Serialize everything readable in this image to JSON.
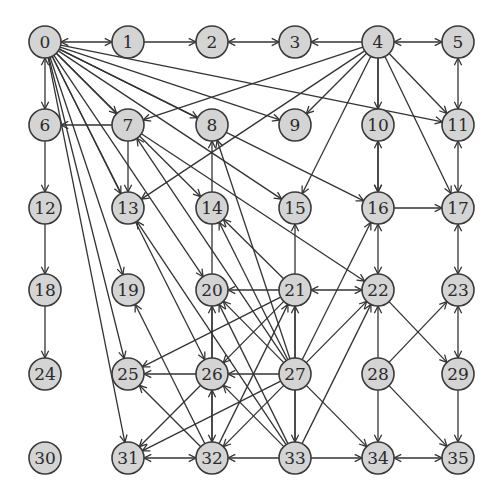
{
  "diagram": {
    "type": "directed-graph",
    "node_radius": 16,
    "colors": {
      "node_fill": "#d4d4d4",
      "node_stroke": "#3a3a3a",
      "edge": "#333333",
      "label": "#2a2a2a"
    },
    "columns_x": [
      45,
      128,
      212,
      295,
      378,
      458
    ],
    "rows_y": [
      42,
      125,
      208,
      290,
      374,
      458
    ],
    "nodes": [
      {
        "id": "0",
        "label": "0"
      },
      {
        "id": "1",
        "label": "1"
      },
      {
        "id": "2",
        "label": "2"
      },
      {
        "id": "3",
        "label": "3"
      },
      {
        "id": "4",
        "label": "4"
      },
      {
        "id": "5",
        "label": "5"
      },
      {
        "id": "6",
        "label": "6"
      },
      {
        "id": "7",
        "label": "7"
      },
      {
        "id": "8",
        "label": "8"
      },
      {
        "id": "9",
        "label": "9"
      },
      {
        "id": "10",
        "label": "10"
      },
      {
        "id": "11",
        "label": "11"
      },
      {
        "id": "12",
        "label": "12"
      },
      {
        "id": "13",
        "label": "13"
      },
      {
        "id": "14",
        "label": "14"
      },
      {
        "id": "15",
        "label": "15"
      },
      {
        "id": "16",
        "label": "16"
      },
      {
        "id": "17",
        "label": "17"
      },
      {
        "id": "18",
        "label": "18"
      },
      {
        "id": "19",
        "label": "19"
      },
      {
        "id": "20",
        "label": "20"
      },
      {
        "id": "21",
        "label": "21"
      },
      {
        "id": "22",
        "label": "22"
      },
      {
        "id": "23",
        "label": "23"
      },
      {
        "id": "24",
        "label": "24"
      },
      {
        "id": "25",
        "label": "25"
      },
      {
        "id": "26",
        "label": "26"
      },
      {
        "id": "27",
        "label": "27"
      },
      {
        "id": "28",
        "label": "28"
      },
      {
        "id": "29",
        "label": "29"
      },
      {
        "id": "30",
        "label": "30"
      },
      {
        "id": "31",
        "label": "31"
      },
      {
        "id": "32",
        "label": "32"
      },
      {
        "id": "33",
        "label": "33"
      },
      {
        "id": "34",
        "label": "34"
      },
      {
        "id": "35",
        "label": "35"
      }
    ],
    "edges": [
      {
        "from": 0,
        "to": 1,
        "bi": true
      },
      {
        "from": 1,
        "to": 2,
        "bi": false
      },
      {
        "from": 3,
        "to": 2,
        "bi": true
      },
      {
        "from": 4,
        "to": 3,
        "bi": false
      },
      {
        "from": 4,
        "to": 5,
        "bi": true
      },
      {
        "from": 0,
        "to": 6,
        "bi": true
      },
      {
        "from": 0,
        "to": 7,
        "bi": false
      },
      {
        "from": 0,
        "to": 8,
        "bi": false
      },
      {
        "from": 0,
        "to": 9,
        "bi": false
      },
      {
        "from": 0,
        "to": 11,
        "bi": false
      },
      {
        "from": 0,
        "to": 13,
        "bi": false
      },
      {
        "from": 0,
        "to": 14,
        "bi": false
      },
      {
        "from": 0,
        "to": 15,
        "bi": false
      },
      {
        "from": 0,
        "to": 16,
        "bi": false
      },
      {
        "from": 0,
        "to": 19,
        "bi": false
      },
      {
        "from": 0,
        "to": 20,
        "bi": false
      },
      {
        "from": 0,
        "to": 25,
        "bi": false
      },
      {
        "from": 0,
        "to": 26,
        "bi": false
      },
      {
        "from": 0,
        "to": 31,
        "bi": false
      },
      {
        "from": 4,
        "to": 7,
        "bi": false
      },
      {
        "from": 4,
        "to": 9,
        "bi": false
      },
      {
        "from": 4,
        "to": 10,
        "bi": false
      },
      {
        "from": 4,
        "to": 11,
        "bi": false
      },
      {
        "from": 4,
        "to": 13,
        "bi": false
      },
      {
        "from": 4,
        "to": 15,
        "bi": false
      },
      {
        "from": 4,
        "to": 17,
        "bi": false
      },
      {
        "from": 4,
        "to": 16,
        "bi": false
      },
      {
        "from": 7,
        "to": 6,
        "bi": false
      },
      {
        "from": 7,
        "to": 13,
        "bi": false
      },
      {
        "from": 7,
        "to": 22,
        "bi": false
      },
      {
        "from": 5,
        "to": 11,
        "bi": true
      },
      {
        "from": 10,
        "to": 16,
        "bi": true
      },
      {
        "from": 11,
        "to": 17,
        "bi": true
      },
      {
        "from": 6,
        "to": 12,
        "bi": false
      },
      {
        "from": 12,
        "to": 18,
        "bi": false
      },
      {
        "from": 18,
        "to": 24,
        "bi": false
      },
      {
        "from": 16,
        "to": 17,
        "bi": false
      },
      {
        "from": 16,
        "to": 22,
        "bi": true
      },
      {
        "from": 17,
        "to": 23,
        "bi": true
      },
      {
        "from": 23,
        "to": 29,
        "bi": true
      },
      {
        "from": 22,
        "to": 21,
        "bi": true
      },
      {
        "from": 21,
        "to": 20,
        "bi": false
      },
      {
        "from": 21,
        "to": 14,
        "bi": false
      },
      {
        "from": 21,
        "to": 26,
        "bi": false
      },
      {
        "from": 21,
        "to": 25,
        "bi": false
      },
      {
        "from": 22,
        "to": 29,
        "bi": false
      },
      {
        "from": 28,
        "to": 23,
        "bi": false
      },
      {
        "from": 28,
        "to": 22,
        "bi": false
      },
      {
        "from": 28,
        "to": 34,
        "bi": false
      },
      {
        "from": 28,
        "to": 35,
        "bi": false
      },
      {
        "from": 29,
        "to": 35,
        "bi": false
      },
      {
        "from": 34,
        "to": 35,
        "bi": true
      },
      {
        "from": 27,
        "to": 8,
        "bi": false
      },
      {
        "from": 27,
        "to": 7,
        "bi": false
      },
      {
        "from": 27,
        "to": 14,
        "bi": false
      },
      {
        "from": 27,
        "to": 16,
        "bi": false
      },
      {
        "from": 27,
        "to": 20,
        "bi": false
      },
      {
        "from": 27,
        "to": 21,
        "bi": false
      },
      {
        "from": 27,
        "to": 22,
        "bi": false
      },
      {
        "from": 27,
        "to": 26,
        "bi": false
      },
      {
        "from": 27,
        "to": 31,
        "bi": false
      },
      {
        "from": 27,
        "to": 32,
        "bi": false
      },
      {
        "from": 27,
        "to": 34,
        "bi": false
      },
      {
        "from": 27,
        "to": 33,
        "bi": false
      },
      {
        "from": 26,
        "to": 25,
        "bi": false
      },
      {
        "from": 26,
        "to": 20,
        "bi": false
      },
      {
        "from": 26,
        "to": 32,
        "bi": true
      },
      {
        "from": 26,
        "to": 31,
        "bi": false
      },
      {
        "from": 32,
        "to": 25,
        "bi": false
      },
      {
        "from": 32,
        "to": 19,
        "bi": false
      },
      {
        "from": 32,
        "to": 21,
        "bi": false
      },
      {
        "from": 32,
        "to": 8,
        "bi": false
      },
      {
        "from": 31,
        "to": 32,
        "bi": true
      },
      {
        "from": 33,
        "to": 32,
        "bi": false
      },
      {
        "from": 33,
        "to": 34,
        "bi": false
      },
      {
        "from": 33,
        "to": 26,
        "bi": false
      },
      {
        "from": 33,
        "to": 20,
        "bi": false
      },
      {
        "from": 33,
        "to": 22,
        "bi": false
      },
      {
        "from": 33,
        "to": 15,
        "bi": false
      },
      {
        "from": 33,
        "to": 13,
        "bi": false
      }
    ]
  }
}
